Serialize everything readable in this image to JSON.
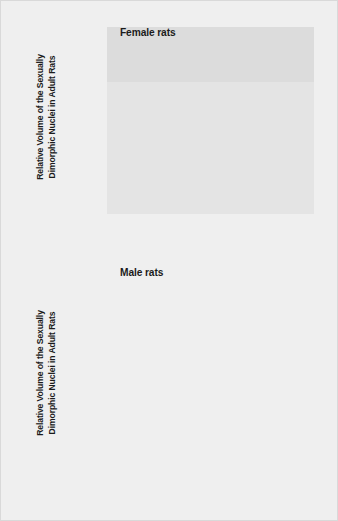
{
  "chart_data": [
    {
      "type": "bar",
      "title": "Female rats",
      "panel": "top",
      "ylabel": "Relative Volume of the Sexually\nDimorphic Nuclei in Adult Rats",
      "xlabel": "",
      "categories": [
        "Placebo\nInjection\non Day 4",
        "Testosterone\nInjection\non Day 4"
      ],
      "values": [
        22,
        47
      ],
      "ylim": [
        0,
        106
      ],
      "yticks": [
        100,
        75,
        50,
        25
      ],
      "ytick_labels": [
        "100%",
        "75%",
        "50%",
        "25%"
      ],
      "grid": true,
      "legend": "none",
      "bar_color": "#8f8f8f",
      "bar_side_color": "#6f6f6f",
      "plot_bg": "#e4e4e4"
    },
    {
      "type": "bar",
      "title": "Male rats",
      "panel": "bottom",
      "ylabel": "Relative Volume of the Sexually\nDimorphic Nuclei in Adult Rats",
      "xlabel": "",
      "categories": [
        "Castration\non Day 1",
        "Castration\non Day 4",
        "Normal\nMale\nControl"
      ],
      "values": [
        50,
        99,
        100
      ],
      "ylim": [
        0,
        106
      ],
      "yticks": [
        100,
        75,
        50,
        25
      ],
      "ytick_labels": [
        "100%",
        "75%",
        "50%",
        "25%"
      ],
      "grid": true,
      "legend": "none",
      "bar_color": "#8f8f8f",
      "bar_side_color": "#6f6f6f",
      "plot_bg": "#e4e4e4"
    }
  ],
  "female_chart": {
    "caption": "Female rats",
    "axis_title": "Relative Volume of the Sexually\nDimorphic Nuclei in Adult Rats",
    "ytick_labels": [
      "100%",
      "75%",
      "50%",
      "25%"
    ],
    "bars": [
      {
        "label": "Placebo\nInjection\non Day 4",
        "value": 22
      },
      {
        "label": "Testosterone\nInjection\non Day 4",
        "value": 47
      }
    ]
  },
  "male_chart": {
    "caption": "Male rats",
    "axis_title": "Relative Volume of the Sexually\nDimorphic Nuclei in Adult Rats",
    "ytick_labels": [
      "100%",
      "75%",
      "50%",
      "25%"
    ],
    "bars": [
      {
        "label": "Castration\non Day 1",
        "value": 50
      },
      {
        "label": "Castration\non Day 4",
        "value": 99
      },
      {
        "label": "Normal\nMale\nControl",
        "value": 100
      }
    ]
  },
  "colors": {
    "page_bg": "#efefef",
    "plot_bg": "#e4e4e4",
    "plot_band": "#dcdcdc",
    "gridline": "#fbfbfb",
    "bar": "#8f8f8f",
    "bar_side": "#6f6f6f",
    "text": "#1b1b1b"
  }
}
